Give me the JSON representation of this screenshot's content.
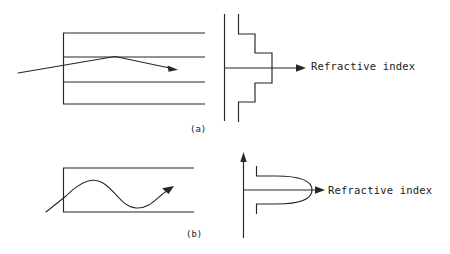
{
  "figure": {
    "type": "technical-diagram",
    "background_color": "#ffffff",
    "ink_color": "#262626",
    "panels": [
      {
        "id": "a",
        "caption": "(a)",
        "fiber_type": "multimode step-index fibre",
        "ray_description": "straight ray segments refracting at layer boundaries, rising then falling, terminating in an arrowhead",
        "profile_description": "symmetric staircase step-index profile about the horizontal axis",
        "axis_label": "Refractive index",
        "fiber_layer_lines_y": [
          33,
          57,
          82,
          104
        ],
        "fiber_left_edge_x": 63,
        "fiber_right_edge_x": 205,
        "profile_axis_x": 224,
        "profile_axis_top_y": 14,
        "profile_axis_bottom_y": 121,
        "profile_center_y": 68,
        "profile_steps_x": [
          238,
          255,
          272
        ],
        "profile_steps_y_upper": [
          14,
          34,
          53
        ],
        "profile_steps_y_lower": [
          122,
          102,
          83
        ],
        "arrow_tip_x": 305,
        "arrow_y": 68
      },
      {
        "id": "b",
        "caption": "(b)",
        "fiber_type": "graded-index fibre",
        "ray_description": "smooth sinusoidal ray path oscillating about the fibre axis, terminating in an arrowhead",
        "profile_description": "rounded parabolic graded-index profile forming a D shape",
        "axis_label": "Refractive index",
        "fiber_top_line_y": 168,
        "fiber_bottom_line_y": 212,
        "fiber_left_edge_x": 63,
        "fiber_right_edge_x": 194,
        "profile_axis_x": 243,
        "profile_axis_top_y": 153,
        "profile_axis_bottom_y": 238,
        "profile_center_y": 190,
        "profile_shoulder_x": 256,
        "profile_max_x": 312,
        "profile_top_y": 166,
        "profile_bottom_y": 214,
        "arrow_tip_x": 324,
        "arrow_y": 190
      }
    ]
  },
  "labels": {
    "panel_a_axis": "Refractive index",
    "panel_b_axis": "Refractive index",
    "caption_a": "(a)",
    "caption_b": "(b)"
  }
}
